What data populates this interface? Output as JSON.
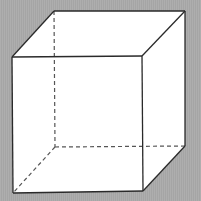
{
  "figure": {
    "background_color": "#aaaaaa",
    "face_fill": "#ffffff",
    "edge_color": "#2a2a2a",
    "hidden_edge_color": "#555555",
    "vertices": {
      "front_top_left": [
        12,
        57
      ],
      "front_top_right": [
        142,
        56
      ],
      "front_bottom_left": [
        13,
        193
      ],
      "front_bottom_right": [
        143,
        191
      ],
      "back_top_left": [
        54,
        11
      ],
      "back_top_right": [
        185,
        11
      ],
      "back_bottom_left": [
        55,
        147
      ],
      "back_bottom_right": [
        185,
        146
      ]
    },
    "visible_edges": 9,
    "hidden_edges": 3
  }
}
